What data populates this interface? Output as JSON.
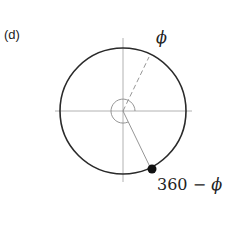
{
  "panel": {
    "label": "(d)"
  },
  "labels": {
    "angle": "ϕ",
    "reflected_prefix": "360 − ",
    "reflected_symbol": "ϕ"
  },
  "colors": {
    "circle": "#2a2a2a",
    "axes": "#9a9a9a",
    "point": "#111111"
  }
}
